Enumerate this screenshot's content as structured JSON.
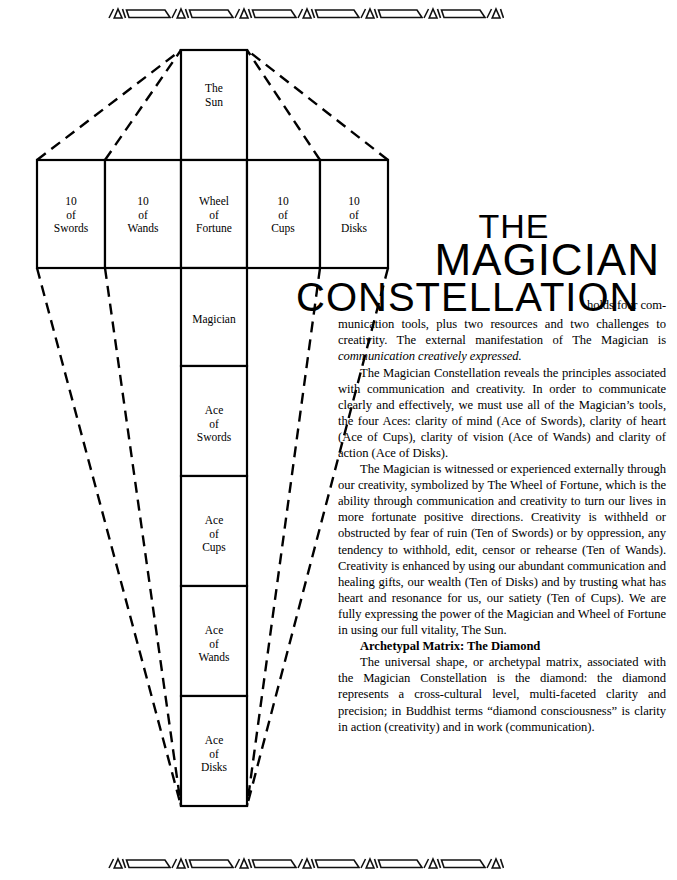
{
  "decor": {
    "motif_name": "deco-rule-motif",
    "repeat_count": 7
  },
  "diagram": {
    "name": "magician-constellation-diagram",
    "top_card": {
      "lines": [
        "The",
        "Sun"
      ]
    },
    "row_cards": [
      {
        "lines": [
          "10",
          "of",
          "Swords"
        ]
      },
      {
        "lines": [
          "10",
          "of",
          "Wands"
        ]
      },
      {
        "lines": [
          "Wheel",
          "of",
          "Fortune"
        ]
      },
      {
        "lines": [
          "10",
          "of",
          "Cups"
        ]
      },
      {
        "lines": [
          "10",
          "of",
          "Disks"
        ]
      }
    ],
    "column_cards": [
      {
        "lines": [
          "Magician"
        ]
      },
      {
        "lines": [
          "Ace",
          "of",
          "Swords"
        ]
      },
      {
        "lines": [
          "Ace",
          "of",
          "Cups"
        ]
      },
      {
        "lines": [
          "Ace",
          "of",
          "Wands"
        ]
      },
      {
        "lines": [
          "Ace",
          "of",
          "Disks"
        ]
      }
    ],
    "stroke_color": "#000000"
  },
  "article": {
    "title_lines": [
      "THE",
      "MAGICIAN",
      "CONSTELLATION"
    ],
    "lead_in": "holds four com-",
    "paragraphs": [
      "munication tools, plus two resources and two challenges to creativity.  The external manifestation of The Magician is ",
      "The Magician Constellation reveals the principles associated with communication and creativity.  In order to communicate clearly and effectively, we must use all of the Magician’s tools, the four Aces:  clarity of mind (Ace of Swords), clarity of heart (Ace of Cups), clarity of vision (Ace of Wands) and clarity of action (Ace of Disks).",
      "The Magician is witnessed or experienced externally through our creativity, symbolized by The Wheel of Fortune, which is the ability through communication and creativity to turn our lives in more fortunate positive directions.  Creativity is withheld or obstructed by fear of ruin (Ten of Swords) or by oppression, any tendency to withhold, edit, censor or rehearse (Ten of Wands).  Creativity is enhanced by using our abundant communication and healing gifts, our wealth (Ten of Disks) and by trusting what has heart and resonance for us, our satiety (Ten of Cups).  We are fully expressing the power of the Magician and Wheel of Fortune in using our full vitality, The Sun."
    ],
    "emphasis_phrase": "communication creatively expressed.",
    "subheading": "Archetypal Matrix:  The Diamond",
    "closing_paragraph": "The universal shape, or archetypal matrix, associated with the Magician Constellation is the diamond: the diamond represents a cross-cultural level, multi-faceted clarity and precision; in Buddhist terms “diamond consciousness” is clarity in action (creativity) and in work (communication)."
  }
}
